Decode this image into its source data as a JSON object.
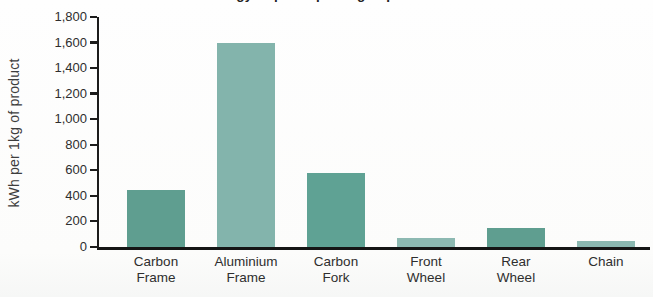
{
  "title_partial": "Energy required per 1kg of product manufactured.",
  "title_note": "title is clipped at the top edge of the scan; only the bottom sliver of the bold text row is visible, ending in 'manufactured.'",
  "y_axis_title": "kWh per 1kg of product",
  "chart_data": {
    "type": "bar",
    "title": "Energy required per 1kg of product manufactured.",
    "xlabel": "",
    "ylabel": "kWh per 1kg of product",
    "categories": [
      "Carbon Frame",
      "Aluminium Frame",
      "Carbon Fork",
      "Front Wheel",
      "Rear Wheel",
      "Chain"
    ],
    "values": [
      450,
      1600,
      580,
      70,
      150,
      50
    ],
    "bar_colors": [
      "#5f9e90",
      "#83b4ac",
      "#5fa294",
      "#8db9b2",
      "#5f9e90",
      "#8bb8b1"
    ],
    "ylim": [
      0,
      1800
    ],
    "yticks": [
      0,
      200,
      400,
      600,
      800,
      1000,
      1200,
      1400,
      1600,
      1800
    ],
    "ytick_labels": [
      "0",
      "200",
      "400",
      "600",
      "800",
      "1,000",
      "1,200",
      "1,400",
      "1,600",
      "1,800"
    ],
    "grid": false,
    "legend": null,
    "axis_color": "#1c1c1c"
  }
}
